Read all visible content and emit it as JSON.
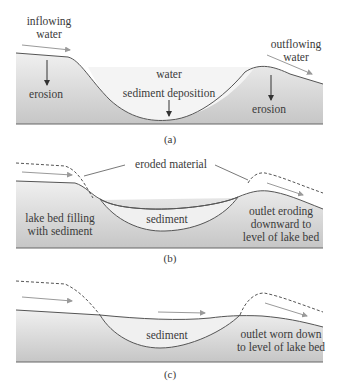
{
  "panel_a": {
    "caption": "(a)",
    "inflowing_line1": "inflowing",
    "inflowing_line2": "water",
    "outflowing_line1": "outflowing",
    "outflowing_line2": "water",
    "water": "water",
    "sediment_deposition": "sediment deposition",
    "erosion_left": "erosion",
    "erosion_right": "erosion"
  },
  "panel_b": {
    "caption": "(b)",
    "eroded_material": "eroded material",
    "lake_bed_line1": "lake bed filling",
    "lake_bed_line2": "with sediment",
    "sediment": "sediment",
    "outlet_line1": "outlet eroding",
    "outlet_line2": "downward to",
    "outlet_line3": "level of lake bed"
  },
  "panel_c": {
    "caption": "(c)",
    "sediment": "sediment",
    "outlet_line1": "outlet worn down",
    "outlet_line2": "to level of lake bed"
  },
  "colors": {
    "ground_top": "#ececec",
    "ground_bottom": "#c9c9c9",
    "water": "#f3f3f3",
    "line": "#555555",
    "arrow": "#9a9a9a",
    "text": "#3a3a3a"
  }
}
